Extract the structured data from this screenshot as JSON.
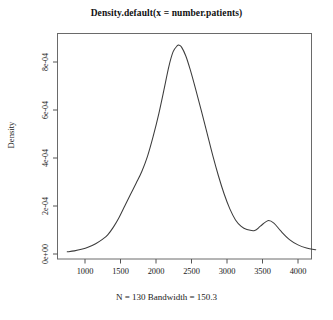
{
  "chart_data": {
    "type": "line",
    "title": "Density.default(x = number.patients)",
    "subtitle": "N = 130  Bandwidth = 150.3",
    "xlabel": "",
    "ylabel": "Density",
    "xlim": [
      700,
      4300
    ],
    "ylim": [
      0,
      0.00094
    ],
    "xticks": [
      1000,
      1500,
      2000,
      2500,
      3000,
      3500,
      4000
    ],
    "xtick_labels": [
      "1000",
      "1500",
      "2000",
      "2500",
      "3000",
      "3500",
      "4000"
    ],
    "yticks": [
      0,
      0.0002,
      0.0004,
      0.0006,
      0.0008
    ],
    "ytick_labels": [
      "0e+00",
      "2e-04",
      "4e-04",
      "6e-04",
      "8e-04"
    ],
    "grid": false,
    "legend": null,
    "line_color": "#3c3c3c",
    "series": [
      {
        "name": "density",
        "x": [
          750,
          850,
          950,
          1050,
          1150,
          1250,
          1320,
          1400,
          1480,
          1560,
          1640,
          1720,
          1800,
          1880,
          1960,
          2040,
          2120,
          2180,
          2240,
          2300,
          2324,
          2360,
          2420,
          2480,
          2560,
          2640,
          2720,
          2800,
          2880,
          2960,
          3040,
          3120,
          3200,
          3280,
          3390,
          3470,
          3575,
          3660,
          3760,
          3880,
          4000,
          4120,
          4250
        ],
        "y": [
          9e-06,
          1.3e-05,
          1.95e-05,
          2.9e-05,
          4.3e-05,
          6.2e-05,
          8e-05,
          0.000112,
          0.000152,
          0.0002,
          0.000248,
          0.000295,
          0.000344,
          0.000407,
          0.00049,
          0.000585,
          0.000695,
          0.00078,
          0.000842,
          0.000868,
          0.00087,
          0.000862,
          0.000825,
          0.00077,
          0.000685,
          0.000595,
          0.000503,
          0.00041,
          0.000325,
          0.00025,
          0.000188,
          0.000142,
          0.000115,
          0.000102,
          9.8e-05,
          0.000116,
          0.000139,
          0.000129,
          9.5e-05,
          6e-05,
          3.8e-05,
          2.5e-05,
          1.8e-05
        ]
      }
    ]
  },
  "axes": {
    "tick_color": "#555555",
    "box_color": "#6a6a6a"
  }
}
